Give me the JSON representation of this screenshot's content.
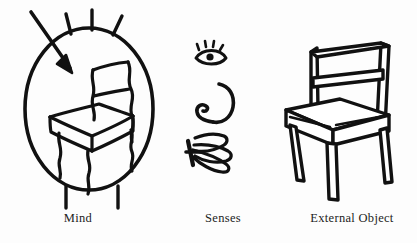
{
  "figure": {
    "background_color": "#fdfdfd",
    "ink_color": "#111111",
    "width": 417,
    "height": 243
  },
  "labels": {
    "mind": "Mind",
    "senses": "Senses",
    "external_object": "External Object"
  },
  "panels": [
    {
      "id": "mind",
      "label": "Mind",
      "description": "Oval head with three hair strokes on top and two body lines below, containing a wobbly hand-drawn chair; an arrow enters from the upper left."
    },
    {
      "id": "senses",
      "label": "Senses",
      "description": "Three sense icons stacked vertically: an eye with lashes, an ear, and a hand with splayed fingers."
    },
    {
      "id": "external_object",
      "label": "External Object",
      "description": "A cleanly drawn wooden chair in three-quarter perspective with a two-slat back, cushioned seat and four tapering legs."
    }
  ],
  "icons": {
    "eye": "eye-icon",
    "ear": "ear-icon",
    "hand": "hand-icon",
    "arrow": "arrow-icon",
    "head": "head-oval-icon",
    "mind_chair": "sketch-chair-icon",
    "real_chair": "chair-icon"
  }
}
